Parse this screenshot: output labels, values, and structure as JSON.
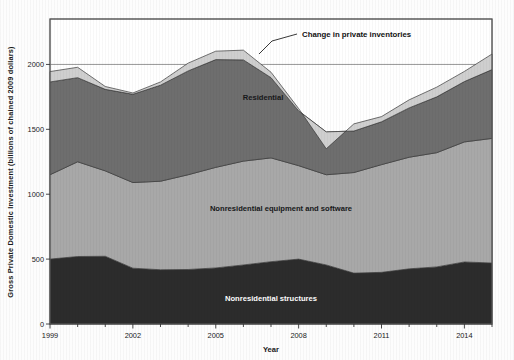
{
  "figure": {
    "background_color": "#fdfdfd",
    "plot_background_color": "#ffffff",
    "frame_color": "#555555"
  },
  "axes": {
    "y_title": "Gross Private Domestic Investment (billions of chained 2009 dollars)",
    "x_title": "Year",
    "y_ticks": [
      "0",
      "500",
      "1000",
      "1500",
      "2000"
    ],
    "x_ticks": [
      "1999",
      "2002",
      "2005",
      "2008",
      "2011",
      "2014"
    ]
  },
  "annotations": {
    "inventories_callout": "Change in private inventories",
    "residential_label": "Residential",
    "equipment_label": "Nonresidential equipment and software",
    "structures_label": "Nonresidential structures"
  },
  "chart_data": {
    "type": "area",
    "title": "",
    "subtitle": "",
    "xlabel": "Year",
    "ylabel": "Gross Private Domestic Investment (billions of chained 2009 dollars)",
    "xlim": [
      1999,
      2015
    ],
    "ylim": [
      0,
      2350
    ],
    "ytick_values": [
      0,
      500,
      1000,
      1500,
      2000
    ],
    "xtick_values": [
      1999,
      2002,
      2005,
      2008,
      2011,
      2014
    ],
    "grid": "horizontal gridline at y=2000 only",
    "legend_position": "inline labels inside bands",
    "stacked": true,
    "x": [
      1999,
      2000,
      2001,
      2002,
      2003,
      2004,
      2005,
      2006,
      2007,
      2008,
      2009,
      2010,
      2011,
      2012,
      2013,
      2014,
      2015
    ],
    "series": [
      {
        "name": "Nonresidential structures",
        "color": "#2c2c2c",
        "values": [
          500,
          520,
          522,
          430,
          418,
          420,
          432,
          455,
          480,
          500,
          455,
          392,
          398,
          425,
          440,
          478,
          470
        ]
      },
      {
        "name": "Nonresidential equipment and software",
        "color": "#a8a8a8",
        "values": [
          650,
          730,
          658,
          660,
          682,
          730,
          775,
          800,
          800,
          720,
          695,
          775,
          830,
          860,
          880,
          925,
          960
        ]
      },
      {
        "name": "Residential",
        "color": "#6e6e6e",
        "values": [
          715,
          648,
          628,
          680,
          740,
          800,
          830,
          780,
          618,
          422,
          330,
          320,
          330,
          380,
          430,
          465,
          530
        ]
      },
      {
        "name": "Change in private inventories",
        "color": "#cfcfcf",
        "values": [
          80,
          80,
          22,
          10,
          25,
          60,
          65,
          75,
          42,
          18,
          -130,
          55,
          40,
          62,
          75,
          78,
          120
        ]
      }
    ],
    "totals": [
      1945,
      1978,
      1830,
      1780,
      1865,
      2010,
      2102,
      2110,
      1940,
      1660,
      1350,
      1542,
      1598,
      1727,
      1825,
      1946,
      2080
    ]
  }
}
